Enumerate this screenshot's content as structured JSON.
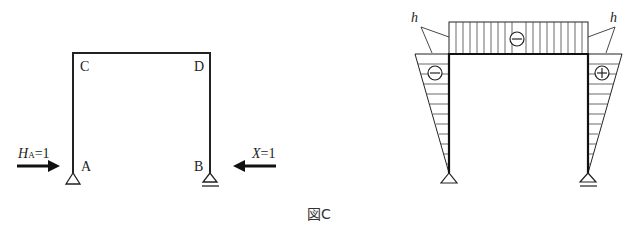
{
  "figure": {
    "caption": "図C",
    "left_frame": {
      "nodes": {
        "top_left": "C",
        "top_right": "D",
        "bottom_left": "A",
        "bottom_right": "B"
      },
      "supports": {
        "A": "pin",
        "B": "roller"
      },
      "loads": {
        "left": {
          "label_main": "H",
          "label_sub": "A",
          "label_eq": "=1",
          "direction": "right"
        },
        "right": {
          "label_main": "X",
          "label_eq": "=1",
          "direction": "left"
        }
      }
    },
    "right_diagram": {
      "type": "bending-moment-diagram",
      "beam_sign": "−",
      "left_column_sign": "−",
      "right_column_sign": "+",
      "magnitude_label_left": "h",
      "magnitude_label_right": "h"
    }
  }
}
